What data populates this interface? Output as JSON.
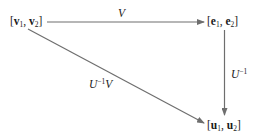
{
  "diagram": {
    "type": "commutative-diagram",
    "nodes": [
      {
        "id": "v",
        "bracket_open": "[",
        "parts": [
          {
            "sym": "v",
            "sub": "1"
          },
          {
            "sym": "v",
            "sub": "2"
          }
        ],
        "bracket_close": "]",
        "text": "[v1, v2]"
      },
      {
        "id": "e",
        "bracket_open": "[",
        "parts": [
          {
            "sym": "e",
            "sub": "1"
          },
          {
            "sym": "e",
            "sub": "2"
          }
        ],
        "bracket_close": "]",
        "text": "[e1, e2]"
      },
      {
        "id": "u",
        "bracket_open": "[",
        "parts": [
          {
            "sym": "u",
            "sub": "1"
          },
          {
            "sym": "u",
            "sub": "2"
          }
        ],
        "bracket_close": "]",
        "text": "[u1, u2]"
      }
    ],
    "edges": [
      {
        "from": "v",
        "to": "e",
        "label_base": "V",
        "label_sup": "",
        "label_tail": "",
        "label_text": "V"
      },
      {
        "from": "e",
        "to": "u",
        "label_base": "U",
        "label_sup": "−1",
        "label_tail": "",
        "label_text": "U^-1"
      },
      {
        "from": "v",
        "to": "u",
        "label_base": "U",
        "label_sup": "−1",
        "label_tail": "V",
        "label_text": "U^-1 V"
      }
    ],
    "separator": ", ",
    "colors": {
      "line": "#6e6e6e",
      "text": "#1a1a1a",
      "background": "#ffffff"
    }
  }
}
